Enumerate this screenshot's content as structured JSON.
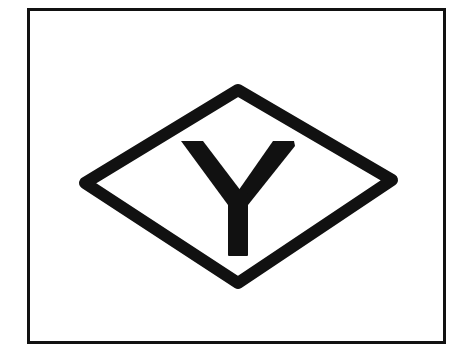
{
  "figure": {
    "letter": "Y",
    "colors": {
      "background": "#ffffff",
      "stroke": "#111111",
      "fill": "#111111"
    },
    "shape": "diamond"
  }
}
